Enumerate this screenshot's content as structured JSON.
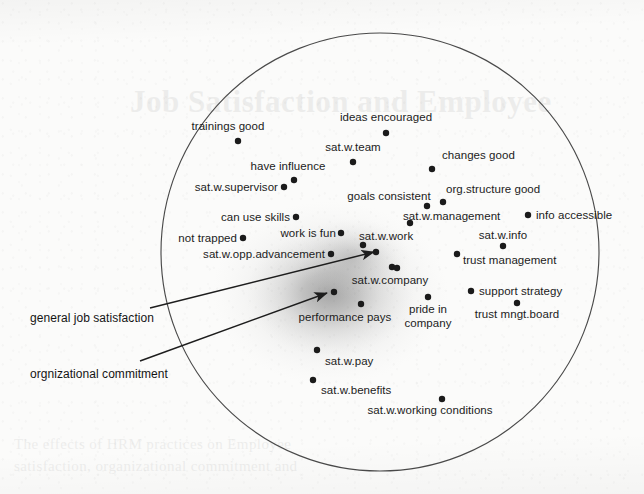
{
  "figure": {
    "type": "scatter",
    "title": "",
    "boundary": {
      "shape": "circle",
      "cx": 380,
      "cy": 252,
      "r": 219
    },
    "density_blob": {
      "cx": 330,
      "cy": 293,
      "rx": 96,
      "ry": 72,
      "color": "#9a9a9a"
    }
  },
  "annotations": [
    {
      "id": "general-job-satisfaction",
      "label": "general job satisfaction",
      "label_x": 30,
      "label_y": 322,
      "arrow_from_x": 150,
      "arrow_from_y": 308,
      "arrow_to_x": 374,
      "arrow_to_y": 252
    },
    {
      "id": "orgnizational-commitment",
      "label": "orgnizational commitment",
      "label_x": 30,
      "label_y": 378,
      "arrow_from_x": 140,
      "arrow_from_y": 361,
      "arrow_to_x": 327,
      "arrow_to_y": 293
    }
  ],
  "chart_data": {
    "type": "scatter",
    "title": "",
    "xlabel": "",
    "ylabel": "",
    "grid": false,
    "legend": "none",
    "points": [
      {
        "label": "trainings good",
        "x": 238,
        "y": 141,
        "label_x": 228,
        "label_y": 130,
        "anchor": "middle"
      },
      {
        "label": "ideas encouraged",
        "x": 386,
        "y": 133,
        "label_x": 386,
        "label_y": 121,
        "anchor": "middle"
      },
      {
        "label": "sat.w.team",
        "x": 353,
        "y": 162,
        "label_x": 353,
        "label_y": 151,
        "anchor": "middle"
      },
      {
        "label": "changes good",
        "x": 432,
        "y": 169,
        "label_x": 442,
        "label_y": 159,
        "anchor": "start"
      },
      {
        "label": "have influence",
        "x": 294,
        "y": 180,
        "label_x": 288,
        "label_y": 170,
        "anchor": "middle"
      },
      {
        "label": "sat.w.supervisor",
        "x": 284,
        "y": 187,
        "label_x": 278,
        "label_y": 191,
        "anchor": "end"
      },
      {
        "label": "goals consistent",
        "x": 427,
        "y": 206,
        "label_x": 389,
        "label_y": 200,
        "anchor": "middle"
      },
      {
        "label": "org.structure good",
        "x": 443,
        "y": 202,
        "label_x": 446,
        "label_y": 193,
        "anchor": "start"
      },
      {
        "label": "can use skills",
        "x": 296,
        "y": 217,
        "label_x": 290,
        "label_y": 221,
        "anchor": "end"
      },
      {
        "label": "sat.w.management",
        "x": 410,
        "y": 223,
        "label_x": 403,
        "label_y": 220,
        "anchor": "start"
      },
      {
        "label": "info accessible",
        "x": 528,
        "y": 215,
        "label_x": 536,
        "label_y": 219,
        "anchor": "start"
      },
      {
        "label": "work is fun",
        "x": 341,
        "y": 233,
        "label_x": 336,
        "label_y": 237,
        "anchor": "end"
      },
      {
        "label": "not trapped",
        "x": 243,
        "y": 238,
        "label_x": 237,
        "label_y": 242,
        "anchor": "end"
      },
      {
        "label": "sat.w.work",
        "x": 363,
        "y": 245,
        "label_x": 359,
        "label_y": 240,
        "anchor": "start"
      },
      {
        "label": "sat.w.info",
        "x": 503,
        "y": 246,
        "label_x": 503,
        "label_y": 239,
        "anchor": "middle"
      },
      {
        "label": "sat.w.opp.advancement",
        "x": 331,
        "y": 254,
        "label_x": 325,
        "label_y": 258,
        "anchor": "end"
      },
      {
        "label": "trust management",
        "x": 457,
        "y": 254,
        "label_x": 463,
        "label_y": 264,
        "anchor": "start"
      },
      {
        "label": "",
        "x": 376,
        "y": 252,
        "label_x": 0,
        "label_y": 0,
        "anchor": "middle"
      },
      {
        "label": "",
        "x": 392,
        "y": 267,
        "label_x": 0,
        "label_y": 0,
        "anchor": "middle"
      },
      {
        "label": "sat.w.company",
        "x": 397,
        "y": 268,
        "label_x": 390,
        "label_y": 284,
        "anchor": "middle"
      },
      {
        "label": "support strategy",
        "x": 471,
        "y": 291,
        "label_x": 479,
        "label_y": 295,
        "anchor": "start"
      },
      {
        "label": "trust mngt.board",
        "x": 517,
        "y": 303,
        "label_x": 517,
        "label_y": 318,
        "anchor": "middle"
      },
      {
        "label": "pride in",
        "x": 428,
        "y": 297,
        "label_x": 428,
        "label_y": 313,
        "anchor": "middle"
      },
      {
        "label": "company",
        "x": -99,
        "y": -99,
        "label_x": 428,
        "label_y": 327,
        "anchor": "middle"
      },
      {
        "label": "",
        "x": 334,
        "y": 292,
        "label_x": 0,
        "label_y": 0,
        "anchor": "middle"
      },
      {
        "label": "performance pays",
        "x": 361,
        "y": 304,
        "label_x": 345,
        "label_y": 321,
        "anchor": "middle"
      },
      {
        "label": "sat.w.pay",
        "x": 317,
        "y": 350,
        "label_x": 325,
        "label_y": 365,
        "anchor": "start"
      },
      {
        "label": "sat.w.benefits",
        "x": 313,
        "y": 380,
        "label_x": 321,
        "label_y": 394,
        "anchor": "start"
      },
      {
        "label": "sat.w.working conditions",
        "x": 442,
        "y": 399,
        "label_x": 430,
        "label_y": 414,
        "anchor": "middle"
      }
    ]
  },
  "bleed_through": {
    "top_title": "Job Satisfaction and Employee",
    "bottom_line_1": "The effects of HRM practices on Employee",
    "bottom_line_2": "satisfaction, organizational commitment and"
  }
}
